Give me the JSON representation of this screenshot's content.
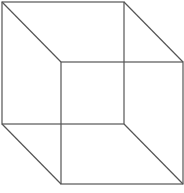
{
  "diagram": {
    "type": "wireframe-cube",
    "stroke_color": "#555555",
    "background": "#ffffff",
    "back_face": {
      "x1": 2,
      "y1": 2,
      "x2": 124,
      "y2": 124
    },
    "front_face": {
      "x1": 61,
      "y1": 62,
      "x2": 183,
      "y2": 184
    }
  }
}
